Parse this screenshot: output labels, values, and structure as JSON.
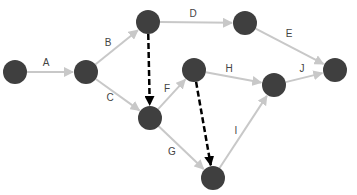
{
  "diagram": {
    "type": "activity-network",
    "colors": {
      "node": "#3f3f3f",
      "edge": "#c8c8c8",
      "dummy_edge": "#000000",
      "label": "#444444",
      "background": "#ffffff"
    },
    "nodes": [
      {
        "id": "n1",
        "x": 15,
        "y": 72
      },
      {
        "id": "n2",
        "x": 86,
        "y": 72
      },
      {
        "id": "n3",
        "x": 148,
        "y": 22
      },
      {
        "id": "n4",
        "x": 245,
        "y": 23
      },
      {
        "id": "n5",
        "x": 194,
        "y": 70
      },
      {
        "id": "n6",
        "x": 274,
        "y": 85
      },
      {
        "id": "n7",
        "x": 335,
        "y": 70
      },
      {
        "id": "n8",
        "x": 150,
        "y": 118
      },
      {
        "id": "n9",
        "x": 213,
        "y": 178
      }
    ],
    "edges": [
      {
        "label": "A",
        "from": "n1",
        "to": "n2",
        "dummy": false,
        "lx": 46,
        "ly": 66
      },
      {
        "label": "B",
        "from": "n2",
        "to": "n3",
        "dummy": false,
        "lx": 108,
        "ly": 46
      },
      {
        "label": "C",
        "from": "n2",
        "to": "n8",
        "dummy": false,
        "lx": 110,
        "ly": 101
      },
      {
        "label": "D",
        "from": "n3",
        "to": "n4",
        "dummy": false,
        "lx": 193,
        "ly": 17
      },
      {
        "label": "E",
        "from": "n4",
        "to": "n7",
        "dummy": false,
        "lx": 289,
        "ly": 37
      },
      {
        "label": "F",
        "from": "n8",
        "to": "n5",
        "dummy": false,
        "lx": 167,
        "ly": 92
      },
      {
        "label": "G",
        "from": "n8",
        "to": "n9",
        "dummy": false,
        "lx": 172,
        "ly": 155
      },
      {
        "label": "H",
        "from": "n5",
        "to": "n6",
        "dummy": false,
        "lx": 229,
        "ly": 72
      },
      {
        "label": "I",
        "from": "n9",
        "to": "n6",
        "dummy": false,
        "lx": 236,
        "ly": 134
      },
      {
        "label": "J",
        "from": "n6",
        "to": "n7",
        "dummy": false,
        "lx": 302,
        "ly": 72
      },
      {
        "label": "",
        "from": "n3",
        "to": "n8",
        "dummy": true
      },
      {
        "label": "",
        "from": "n5",
        "to": "n9",
        "dummy": true
      }
    ],
    "node_radius": 12
  }
}
